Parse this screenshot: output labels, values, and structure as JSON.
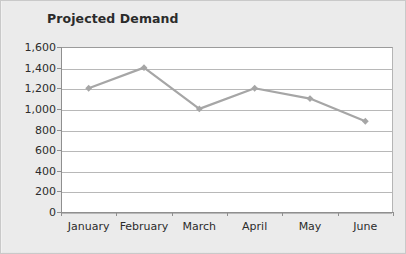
{
  "chart_data": {
    "type": "line",
    "title": "Projected Demand",
    "xlabel": "",
    "ylabel": "",
    "categories": [
      "January",
      "February",
      "March",
      "April",
      "May",
      "June"
    ],
    "values": [
      1200,
      1400,
      1000,
      1200,
      1100,
      880
    ],
    "series": [
      {
        "name": "Projected Demand",
        "values": [
          1200,
          1400,
          1000,
          1200,
          1100,
          880
        ]
      }
    ],
    "ylim": [
      0,
      1600
    ],
    "ytick_step": 200,
    "ytick_labels": [
      "1,600",
      "1,400",
      "1,200",
      "1,000",
      "800",
      "600",
      "400",
      "200",
      "0"
    ],
    "ytick_values": [
      1600,
      1400,
      1200,
      1000,
      800,
      600,
      400,
      200,
      0
    ],
    "grid": true,
    "grid_axis": "y",
    "legend": false,
    "legend_position": "none",
    "marker": "diamond",
    "colors": {
      "line": "#a6a6a6",
      "marker": "#a6a6a6",
      "gridline": "#b8b8b8",
      "axis": "#8f8f8f",
      "plot_background": "#ffffff",
      "figure_background": "#ebebeb",
      "text": "#2b2b2b"
    }
  }
}
